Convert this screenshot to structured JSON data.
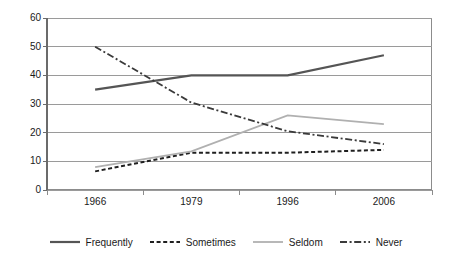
{
  "chart_data": {
    "type": "line",
    "title": "",
    "subtitle": "",
    "xlabel": "",
    "ylabel": "",
    "categories": [
      "1966",
      "1979",
      "1996",
      "2006"
    ],
    "ylim": [
      0,
      60
    ],
    "yticks": [
      0,
      10,
      20,
      30,
      40,
      50,
      60
    ],
    "ytick_labels": [
      "0",
      "10",
      "20",
      "30",
      "40",
      "50",
      "60"
    ],
    "grid": "horizontal",
    "legend_position": "bottom",
    "series": [
      {
        "name": "Frequently",
        "values": [
          35,
          40,
          40,
          47
        ],
        "color": "#555555",
        "style": "solid",
        "width": 2.2
      },
      {
        "name": "Sometimes",
        "values": [
          6.5,
          13,
          13,
          14
        ],
        "color": "#1f1f1f",
        "style": "dashed",
        "width": 2.0
      },
      {
        "name": "Seldom",
        "values": [
          8,
          13.5,
          26,
          23
        ],
        "color": "#b0b0b0",
        "style": "solid",
        "width": 1.8
      },
      {
        "name": "Never",
        "values": [
          50,
          30.5,
          20.5,
          16
        ],
        "color": "#3a3a3a",
        "style": "dashdot",
        "width": 1.8
      }
    ],
    "axis_color": "#8c8c8c",
    "gridline_color": "#9a9a9a",
    "background": "#ffffff"
  }
}
